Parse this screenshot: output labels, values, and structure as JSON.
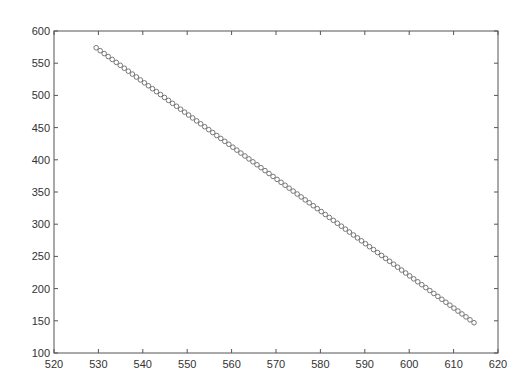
{
  "chart_data": {
    "type": "scatter",
    "title": "",
    "xlabel": "",
    "ylabel": "",
    "xlim": [
      520,
      620
    ],
    "ylim": [
      100,
      600
    ],
    "xticks": [
      520,
      530,
      540,
      550,
      560,
      570,
      580,
      590,
      600,
      610,
      620
    ],
    "yticks": [
      100,
      150,
      200,
      250,
      300,
      350,
      400,
      450,
      500,
      550,
      600
    ],
    "grid": false,
    "legend": null,
    "marker": "circle-open",
    "marker_color": "#777777",
    "series": [
      {
        "name": "data",
        "x_start": 529.5,
        "x_end": 614.6,
        "y_start": 574,
        "y_end": 147,
        "n_points": 95,
        "trend": "linear decreasing, slope ≈ -5.02"
      }
    ]
  }
}
